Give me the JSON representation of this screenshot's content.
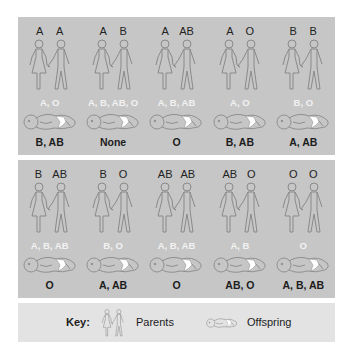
{
  "panels": [
    {
      "cells": [
        {
          "parents": [
            "A",
            "A"
          ],
          "possible_offspring": "A, O",
          "impossible_offspring": "B, AB"
        },
        {
          "parents": [
            "A",
            "B"
          ],
          "possible_offspring": "A, B, AB, O",
          "impossible_offspring": "None"
        },
        {
          "parents": [
            "A",
            "AB"
          ],
          "possible_offspring": "A, B, AB",
          "impossible_offspring": "O"
        },
        {
          "parents": [
            "A",
            "O"
          ],
          "possible_offspring": "A, O",
          "impossible_offspring": "B, AB"
        },
        {
          "parents": [
            "B",
            "B"
          ],
          "possible_offspring": "B, O",
          "impossible_offspring": "A, AB"
        }
      ]
    },
    {
      "cells": [
        {
          "parents": [
            "B",
            "AB"
          ],
          "possible_offspring": "A, B, AB",
          "impossible_offspring": "O"
        },
        {
          "parents": [
            "B",
            "O"
          ],
          "possible_offspring": "B, O",
          "impossible_offspring": "A, AB"
        },
        {
          "parents": [
            "AB",
            "AB"
          ],
          "possible_offspring": "A, B, AB",
          "impossible_offspring": "O"
        },
        {
          "parents": [
            "AB",
            "O"
          ],
          "possible_offspring": "A, B",
          "impossible_offspring": "AB, O"
        },
        {
          "parents": [
            "O",
            "O"
          ],
          "possible_offspring": "O",
          "impossible_offspring": "A, B, AB"
        }
      ]
    }
  ],
  "key": {
    "label": "Key:",
    "parents_label": "Parents",
    "parents_icon": "parents-couple-icon",
    "offspring_label": "Offspring",
    "offspring_icon": "sleeping-baby-icon"
  },
  "colors": {
    "panel_bg": "#c6c6c6",
    "key_bg": "#e3e3e3",
    "possible_text": "#f2f2f2",
    "impossible_text": "#1c1c1c",
    "outline": "#8a8a8a"
  }
}
